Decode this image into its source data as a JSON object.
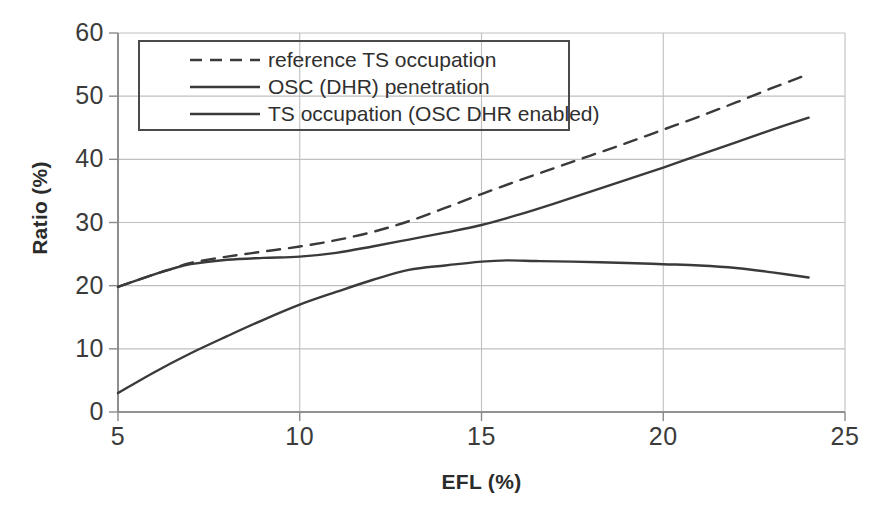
{
  "chart_data": {
    "type": "line",
    "title": "",
    "xlabel": "EFL (%)",
    "ylabel": "Ratio (%)",
    "xlim": [
      5,
      25
    ],
    "ylim": [
      0,
      60
    ],
    "xticks": [
      "5",
      "10",
      "15",
      "20",
      "25"
    ],
    "yticks": [
      "0",
      "10",
      "20",
      "30",
      "40",
      "50",
      "60"
    ],
    "grid": true,
    "legend_position": "upper-left",
    "series": [
      {
        "name": "reference TS occupation",
        "style": "dashed",
        "color": "#3a3a3a",
        "x": [
          5,
          6,
          6.5,
          7,
          8,
          9,
          10,
          11,
          12,
          13,
          14,
          15,
          16,
          17,
          18,
          19,
          20,
          21,
          22,
          23,
          24
        ],
        "y": [
          19.8,
          21.8,
          22.7,
          23.6,
          24.6,
          25.4,
          26.2,
          27.2,
          28.5,
          30.2,
          32.3,
          34.5,
          36.6,
          38.6,
          40.6,
          42.6,
          44.7,
          46.8,
          49.0,
          51.3,
          53.5
        ]
      },
      {
        "name": "OSC (DHR) penetration",
        "style": "solid",
        "color": "#3a3a3a",
        "x": [
          5,
          6,
          6.5,
          7,
          8,
          9,
          10,
          11,
          12,
          13,
          14,
          15,
          16,
          17,
          18,
          19,
          20,
          21,
          22,
          23,
          24
        ],
        "y": [
          19.8,
          21.8,
          22.7,
          23.4,
          24.1,
          24.4,
          24.6,
          25.2,
          26.2,
          27.3,
          28.4,
          29.6,
          31.2,
          33.0,
          34.9,
          36.8,
          38.7,
          40.7,
          42.7,
          44.7,
          46.6
        ]
      },
      {
        "name": "TS occupation (OSC DHR enabled)",
        "style": "solid",
        "color": "#3a3a3a",
        "x": [
          5,
          6,
          7,
          8,
          9,
          10,
          11,
          12,
          13,
          14,
          15,
          15.7,
          16.5,
          17.5,
          19,
          20,
          21,
          22,
          23,
          24
        ],
        "y": [
          3.0,
          6.3,
          9.3,
          12.0,
          14.6,
          17.0,
          19.0,
          20.9,
          22.5,
          23.2,
          23.8,
          24.0,
          23.9,
          23.8,
          23.6,
          23.4,
          23.2,
          22.8,
          22.1,
          21.3
        ]
      }
    ]
  }
}
